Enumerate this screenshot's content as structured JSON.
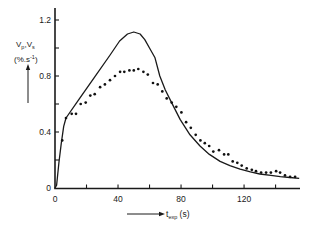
{
  "labels": {
    "y_v1": "V",
    "y_sub1": "p",
    "y_sep": ",V",
    "y_sub2": "s",
    "y_units": "(%.s",
    "y_units_sup": "-1",
    "y_units_close": ")",
    "x_t": "t",
    "x_sub": "exp",
    "x_units": " (s)"
  },
  "chart_data": {
    "type": "line",
    "title": "",
    "xlabel": "t_exp (s)",
    "ylabel": "Vp,Vs (%.s-1)",
    "xlim": [
      0,
      155.5
    ],
    "ylim": [
      0,
      1.2
    ],
    "x_ticks": [
      0,
      20,
      40,
      60,
      80,
      100,
      120,
      140
    ],
    "x_tick_labels": [
      "0",
      "",
      "40",
      "",
      "80",
      "",
      "120",
      ""
    ],
    "y_ticks": [
      0,
      0.2,
      0.4,
      0.6,
      0.8,
      1.0,
      1.2
    ],
    "y_tick_labels": [
      "0",
      "",
      "0.4",
      "",
      "0.8",
      "",
      "1.2"
    ],
    "grid": false,
    "legend": null,
    "series": [
      {
        "name": "solid line",
        "style": "line",
        "x": [
          0,
          1,
          2.5,
          4,
          5.5,
          7,
          15,
          25,
          35,
          41,
          46,
          50,
          54,
          57,
          60,
          63.5,
          66.5,
          70,
          74,
          79.4,
          85.7,
          92,
          98,
          104.8,
          111,
          117.5,
          124,
          130,
          137,
          143,
          149,
          155
        ],
        "y": [
          0,
          0.02,
          0.18,
          0.32,
          0.44,
          0.5,
          0.63,
          0.79,
          0.95,
          1.05,
          1.1,
          1.114,
          1.1,
          1.06,
          1.0,
          0.93,
          0.8,
          0.7,
          0.61,
          0.49,
          0.38,
          0.3,
          0.24,
          0.19,
          0.16,
          0.134,
          0.115,
          0.1,
          0.09,
          0.081,
          0.075,
          0.069
        ]
      },
      {
        "name": "dots",
        "style": "scatter",
        "x": [
          4.6,
          7,
          10.6,
          13.3,
          16.3,
          19.5,
          22.4,
          25.2,
          28.6,
          31.7,
          34.9,
          38.1,
          41.3,
          44.0,
          47.2,
          50.0,
          52.9,
          56.1,
          58.9,
          62.2,
          65.2,
          68.1,
          70.9,
          74.1,
          77.0,
          80.2,
          83.2,
          86.2,
          89.3,
          92.3,
          95.1,
          97.9,
          100.5,
          104.1,
          107.3,
          110.0,
          112.8,
          115.7,
          118.5,
          121.7,
          124.9,
          127.6,
          130.8,
          134.0,
          137.0,
          140.3,
          142.9,
          146.0,
          149.2,
          152.4
        ],
        "y": [
          0.34,
          0.5,
          0.53,
          0.53,
          0.6,
          0.61,
          0.66,
          0.67,
          0.72,
          0.74,
          0.77,
          0.8,
          0.83,
          0.83,
          0.84,
          0.84,
          0.85,
          0.83,
          0.81,
          0.75,
          0.74,
          0.69,
          0.64,
          0.61,
          0.58,
          0.54,
          0.47,
          0.43,
          0.38,
          0.34,
          0.32,
          0.3,
          0.26,
          0.27,
          0.24,
          0.24,
          0.19,
          0.18,
          0.16,
          0.14,
          0.13,
          0.12,
          0.11,
          0.11,
          0.11,
          0.12,
          0.11,
          0.09,
          0.08,
          0.08
        ]
      }
    ]
  }
}
